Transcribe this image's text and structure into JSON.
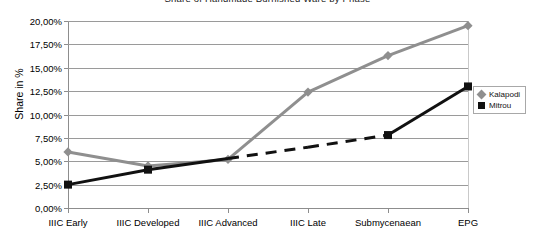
{
  "chart_data": {
    "type": "line",
    "title": "Share of Handmade Burnished Ware by Phase",
    "xlabel": "",
    "ylabel": "Share in %",
    "categories": [
      "IIIC Early",
      "IIIC Developed",
      "IIIC Advanced",
      "IIIC Late",
      "Submycenaean",
      "EPG"
    ],
    "ylim": [
      0,
      20
    ],
    "ytick_labels": [
      "0,00%",
      "2,50%",
      "5,00%",
      "7,50%",
      "10,00%",
      "12,50%",
      "15,00%",
      "17,50%",
      "20,00%"
    ],
    "ytick_values": [
      0,
      2.5,
      5,
      7.5,
      10,
      12.5,
      15,
      17.5,
      20
    ],
    "grid": true,
    "legend_position": "right",
    "series": [
      {
        "name": "Kalapodi",
        "color": "#8f8f8f",
        "marker": "diamond",
        "line_style": "solid",
        "values": [
          6.0,
          4.5,
          5.2,
          12.4,
          16.3,
          19.5
        ]
      },
      {
        "name": "Mitrou",
        "color": "#111111",
        "marker": "square",
        "line_style": "mixed",
        "values": [
          2.5,
          4.1,
          5.3,
          6.5,
          7.8,
          13.0
        ],
        "dashed_segments": [
          [
            2,
            3
          ],
          [
            3,
            4
          ]
        ]
      }
    ]
  },
  "legend": {
    "items": [
      {
        "label": "Kalapodi"
      },
      {
        "label": "Mitrou"
      }
    ]
  }
}
